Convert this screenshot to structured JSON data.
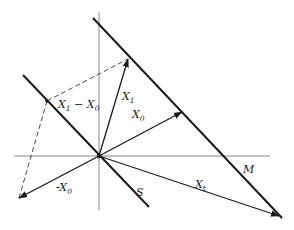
{
  "diagram": {
    "title": "",
    "colors": {
      "line": "#1a1a1a",
      "axis": "#7a7a7a",
      "background": "#ffffff"
    },
    "origin": [
      99,
      156
    ],
    "axes": {
      "horizontal": {
        "x1": 14,
        "y1": 156,
        "x2": 270,
        "y2": 156
      },
      "vertical": {
        "x1": 99,
        "y1": 12,
        "x2": 99,
        "y2": 210
      }
    },
    "planes": [
      {
        "id": "S",
        "label": "S",
        "x1": 23,
        "y1": 75,
        "x2": 149,
        "y2": 207,
        "label_pos": [
          136,
          196
        ]
      },
      {
        "id": "M",
        "label": "M",
        "x1": 93,
        "y1": 18,
        "x2": 282,
        "y2": 218,
        "label_pos": [
          243,
          173
        ]
      }
    ],
    "vectors": [
      {
        "id": "X1",
        "label": "X",
        "sub": "1",
        "from": [
          99,
          156
        ],
        "to": [
          128,
          59
        ],
        "label_pos": [
          122,
          100
        ]
      },
      {
        "id": "X0",
        "label": "X",
        "sub": "0",
        "from": [
          99,
          156
        ],
        "to": [
          182,
          112
        ],
        "label_pos": [
          132,
          118
        ]
      },
      {
        "id": "Xt",
        "label": "X",
        "sub": "t",
        "from": [
          99,
          156
        ],
        "to": [
          279,
          216
        ],
        "label_pos": [
          195,
          188
        ]
      },
      {
        "id": "negX0",
        "label": "-X",
        "sub": "0",
        "from": [
          99,
          156
        ],
        "to": [
          19,
          198
        ],
        "label_pos": [
          56,
          191
        ]
      }
    ],
    "points": [
      {
        "id": "X1-X0",
        "label": "X",
        "sub1": "1",
        "mid": " − X",
        "sub2": "0",
        "pos": [
          47,
          101
        ],
        "label_pos": [
          58,
          108
        ]
      }
    ],
    "dashed_lines": [
      {
        "x1": 47,
        "y1": 101,
        "x2": 128,
        "y2": 59
      },
      {
        "x1": 47,
        "y1": 101,
        "x2": 19,
        "y2": 198
      }
    ]
  }
}
